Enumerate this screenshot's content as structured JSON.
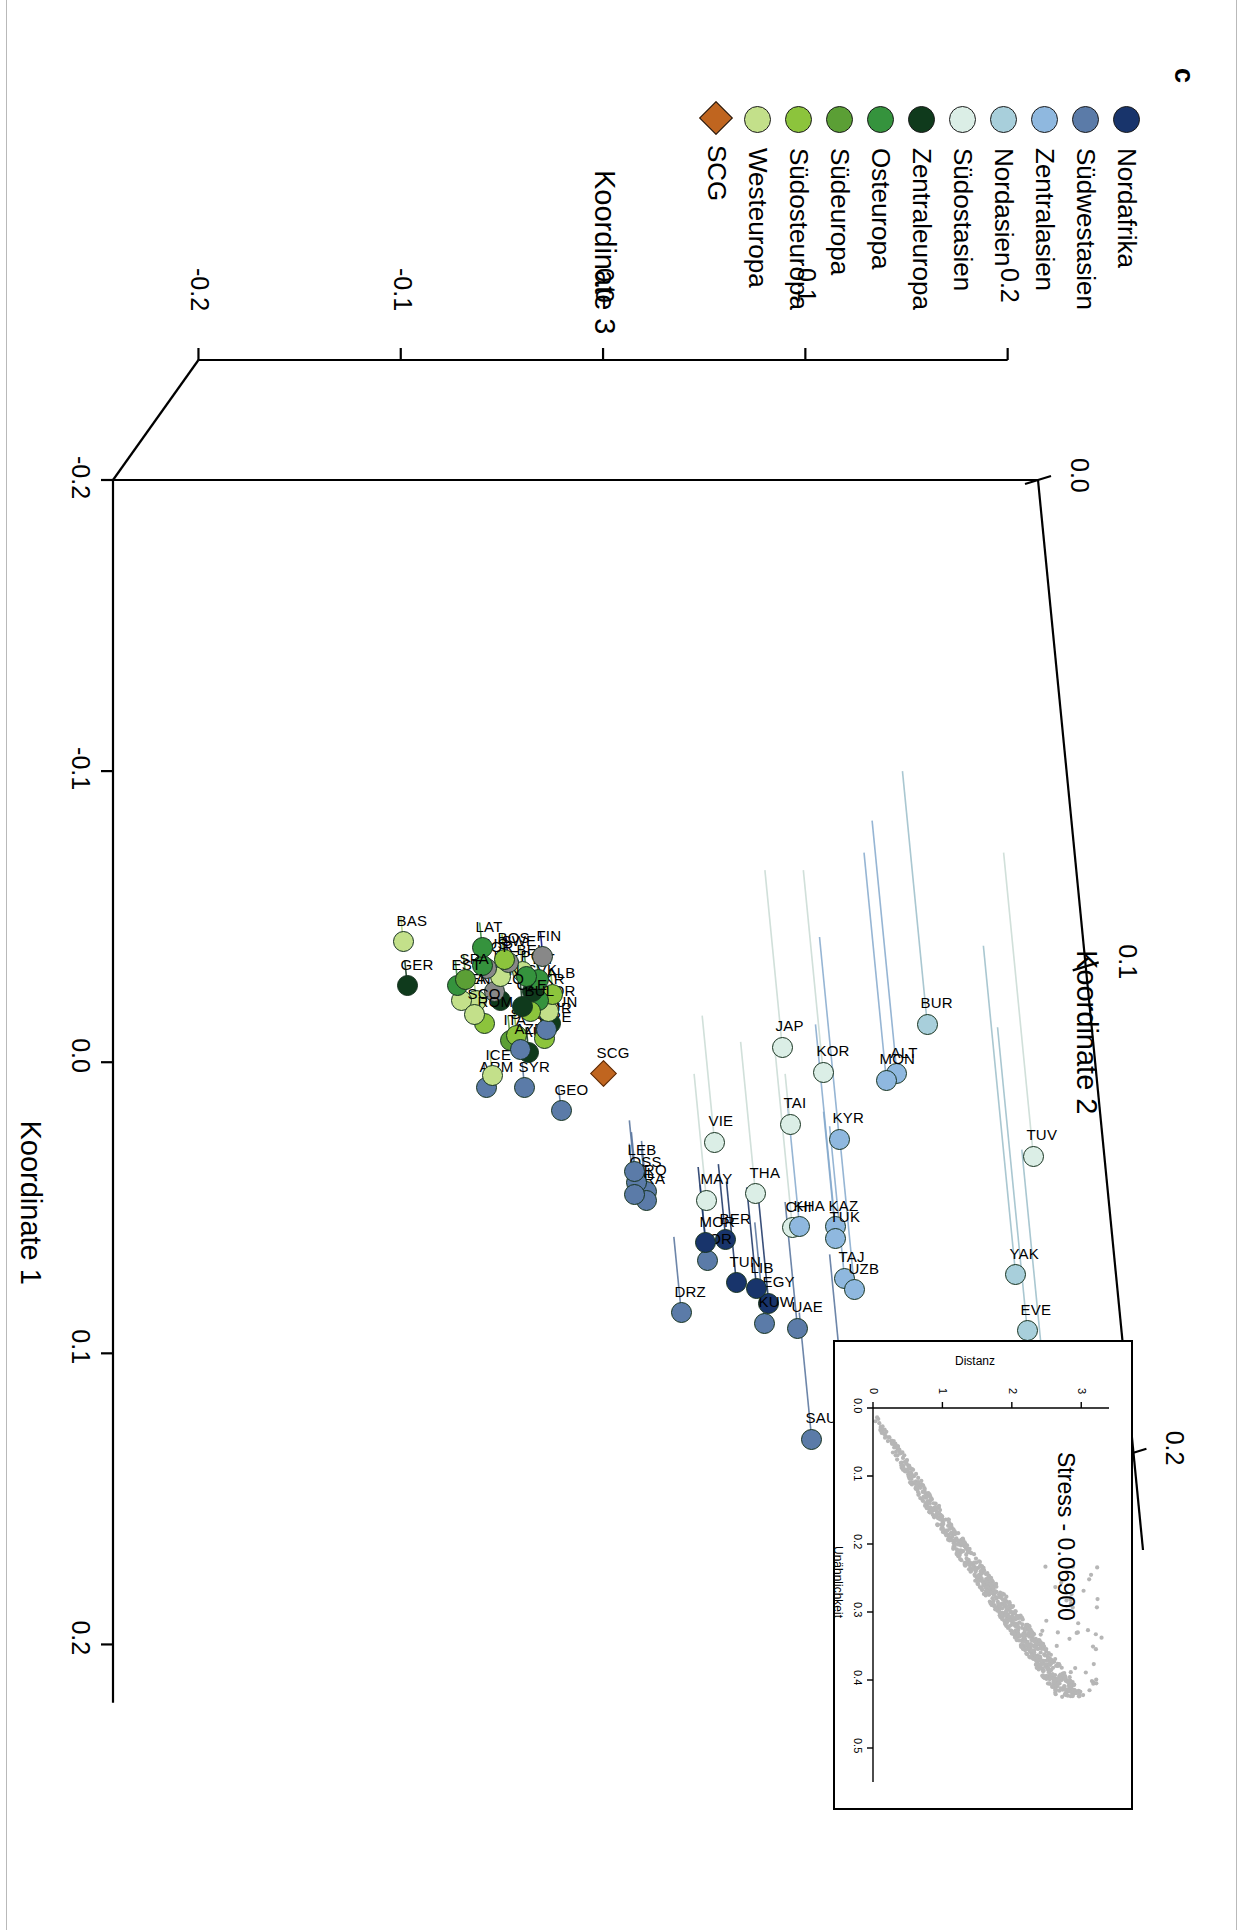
{
  "panel": {
    "letter": "c"
  },
  "legend": {
    "items": [
      {
        "label": "Nordafrika",
        "color": "#18346b",
        "shape": "circle"
      },
      {
        "label": "Südwestasien",
        "color": "#5b7ba8",
        "shape": "circle"
      },
      {
        "label": "Zentralasien",
        "color": "#8fb8df",
        "shape": "circle"
      },
      {
        "label": "Nordasien",
        "color": "#a8cfdb",
        "shape": "circle"
      },
      {
        "label": "Südostasien",
        "color": "#dbeee6",
        "shape": "circle"
      },
      {
        "label": "Zentraleuropa",
        "color": "#0f3a1c",
        "shape": "circle"
      },
      {
        "label": "Osteuropa",
        "color": "#35933d",
        "shape": "circle"
      },
      {
        "label": "Südeuropa",
        "color": "#5b9f35",
        "shape": "circle"
      },
      {
        "label": "Südosteuropa",
        "color": "#8cc43c",
        "shape": "circle"
      },
      {
        "label": "Westeuropa",
        "color": "#c3e08a",
        "shape": "circle"
      },
      {
        "label": "SCG",
        "color": "#c0651f",
        "shape": "diamond"
      }
    ]
  },
  "axes": {
    "x": {
      "title": "Koordinate 1",
      "ticks": [
        "-0.2",
        "-0.1",
        "0.0",
        "0.1",
        "0.2"
      ],
      "values": [
        -0.2,
        -0.1,
        0.0,
        0.1,
        0.2
      ]
    },
    "y": {
      "title": "Koordinate 3",
      "ticks": [
        "-0.2",
        "-0.1",
        "0.0",
        "0.1",
        "0.2"
      ],
      "values": [
        -0.2,
        -0.1,
        0.0,
        0.1,
        0.2
      ]
    },
    "z": {
      "title": "Koordinate 2",
      "ticks": [
        "0.0",
        "0.1",
        "0.2"
      ],
      "values": [
        0.0,
        0.1,
        0.2
      ]
    }
  },
  "inset": {
    "stress_label": "Stress - 0.06900",
    "xlabel": "Unähnlichkeit",
    "ylabel": "Distanz",
    "xticks": [
      "0.0",
      "0.1",
      "0.2",
      "0.3",
      "0.4",
      "0.5"
    ],
    "yticks": [
      "0",
      "1",
      "2",
      "3"
    ],
    "point_color": "#b6b6b6"
  },
  "chart_data": {
    "type": "scatter",
    "title": "",
    "xlabel": "Koordinate 1",
    "ylabel": "Koordinate 3",
    "zlabel": "Koordinate 2",
    "xlim": [
      -0.2,
      0.25
    ],
    "ylim": [
      -0.2,
      0.2
    ],
    "zlim": [
      -0.05,
      0.22
    ],
    "grid": false,
    "legend_position": "top-left",
    "groups": [
      "Nordafrika",
      "Südwestasien",
      "Zentralasien",
      "Nordasien",
      "Südostasien",
      "Zentraleuropa",
      "Osteuropa",
      "Südeuropa",
      "Südosteuropa",
      "Westeuropa",
      "SCG"
    ],
    "points": [
      {
        "label": "EVE",
        "group": "Nordasien",
        "x": -0.012,
        "y": 0.195,
        "z": 0.12
      },
      {
        "label": "KOY",
        "group": "Nordasien",
        "x": 0.03,
        "y": 0.207,
        "z": 0.14
      },
      {
        "label": "YAK",
        "group": "Nordasien",
        "x": -0.04,
        "y": 0.188,
        "z": 0.13
      },
      {
        "label": "TUV",
        "group": "Südostasien",
        "x": -0.072,
        "y": 0.198,
        "z": 0.12
      },
      {
        "label": "BUR",
        "group": "Nordasien",
        "x": -0.1,
        "y": 0.148,
        "z": 0.1
      },
      {
        "label": "ALT",
        "group": "Zentralasien",
        "x": -0.083,
        "y": 0.133,
        "z": 0.1
      },
      {
        "label": "MON",
        "group": "Zentralasien",
        "x": -0.072,
        "y": 0.129,
        "z": 0.09
      },
      {
        "label": "KOR",
        "group": "Südostasien",
        "x": -0.066,
        "y": 0.099,
        "z": 0.08
      },
      {
        "label": "JAP",
        "group": "Südostasien",
        "x": -0.066,
        "y": 0.08,
        "z": 0.07
      },
      {
        "label": "KYR",
        "group": "Zentralasien",
        "x": -0.043,
        "y": 0.107,
        "z": 0.08
      },
      {
        "label": "KAZ",
        "group": "Zentralasien",
        "x": -0.013,
        "y": 0.105,
        "z": 0.08
      },
      {
        "label": "CHI",
        "group": "Südostasien",
        "x": -0.004,
        "y": 0.085,
        "z": 0.07
      },
      {
        "label": "THA",
        "group": "Südostasien",
        "x": -0.007,
        "y": 0.068,
        "z": 0.06
      },
      {
        "label": "MAY",
        "group": "Südostasien",
        "x": 0.004,
        "y": 0.045,
        "z": 0.05
      },
      {
        "label": "VIE",
        "group": "Südostasien",
        "x": -0.016,
        "y": 0.049,
        "z": 0.05
      },
      {
        "label": "TAJ",
        "group": "Zentralasien",
        "x": 0.022,
        "y": 0.112,
        "z": 0.06
      },
      {
        "label": "UZB",
        "group": "Zentralasien",
        "x": 0.026,
        "y": 0.117,
        "z": 0.06
      },
      {
        "label": "TUK",
        "group": "Zentralasien",
        "x": 0.017,
        "y": 0.109,
        "z": 0.05
      },
      {
        "label": "KHA",
        "group": "Zentralasien",
        "x": 0.013,
        "y": 0.091,
        "z": 0.05
      },
      {
        "label": "YEM",
        "group": "Südwestasien",
        "x": 0.066,
        "y": 0.112,
        "z": 0.06
      },
      {
        "label": "SAU",
        "group": "Südwestasien",
        "x": 0.086,
        "y": 0.097,
        "z": 0.05
      },
      {
        "label": "UAE",
        "group": "Südwestasien",
        "x": 0.048,
        "y": 0.09,
        "z": 0.05
      },
      {
        "label": "EGY",
        "group": "Nordafrika",
        "x": 0.048,
        "y": 0.077,
        "z": 0.04
      },
      {
        "label": "KUW",
        "group": "Südwestasien",
        "x": 0.055,
        "y": 0.075,
        "z": 0.04
      },
      {
        "label": "LIB",
        "group": "Nordafrika",
        "x": 0.043,
        "y": 0.071,
        "z": 0.04
      },
      {
        "label": "TUN",
        "group": "Nordafrika",
        "x": 0.041,
        "y": 0.061,
        "z": 0.04
      },
      {
        "label": "BER",
        "group": "Nordafrika",
        "x": 0.035,
        "y": 0.057,
        "z": 0.03
      },
      {
        "label": "JOR",
        "group": "Südwestasien",
        "x": 0.042,
        "y": 0.048,
        "z": 0.03
      },
      {
        "label": "MOR",
        "group": "Nordafrika",
        "x": 0.036,
        "y": 0.047,
        "z": 0.03
      },
      {
        "label": "DRZ",
        "group": "Südwestasien",
        "x": 0.06,
        "y": 0.035,
        "z": 0.03
      },
      {
        "label": "IRQ",
        "group": "Südwestasien",
        "x": 0.027,
        "y": 0.019,
        "z": 0.02
      },
      {
        "label": "IRA",
        "group": "Südwestasien",
        "x": 0.03,
        "y": 0.019,
        "z": 0.02
      },
      {
        "label": "OSS",
        "group": "Südwestasien",
        "x": 0.024,
        "y": 0.014,
        "z": 0.02
      },
      {
        "label": "PAL",
        "group": "Südwestasien",
        "x": 0.028,
        "y": 0.013,
        "z": 0.02
      },
      {
        "label": "LEB",
        "group": "Südwestasien",
        "x": 0.02,
        "y": 0.013,
        "z": 0.02
      },
      {
        "label": "SCG",
        "group": "SCG",
        "x": 0.004,
        "y": 0.0,
        "z": 0.0
      },
      {
        "label": "GEO",
        "group": "Südwestasien",
        "x": 0.008,
        "y": -0.022,
        "z": 0.01
      },
      {
        "label": "SYR",
        "group": "Südwestasien",
        "x": 0.0,
        "y": -0.04,
        "z": 0.01
      },
      {
        "label": "ARM",
        "group": "Südwestasien",
        "x": 0.0,
        "y": -0.059,
        "z": 0.01
      },
      {
        "label": "ICE",
        "group": "Westeuropa",
        "x": -0.004,
        "y": -0.056,
        "z": 0.01
      },
      {
        "label": "AUS",
        "group": "Zentraleuropa",
        "x": -0.012,
        "y": -0.038,
        "z": 0.01
      },
      {
        "label": "ITA",
        "group": "Südeuropa",
        "x": -0.016,
        "y": -0.047,
        "z": 0.01
      },
      {
        "label": "SVA",
        "group": "Südosteuropa",
        "x": -0.018,
        "y": -0.044,
        "z": 0.01
      },
      {
        "label": "AZE",
        "group": "Südwestasien",
        "x": -0.013,
        "y": -0.042,
        "z": 0.01
      },
      {
        "label": "GRE",
        "group": "Südosteuropa",
        "x": -0.017,
        "y": -0.03,
        "z": 0.01
      },
      {
        "label": "HUN",
        "group": "Zentraleuropa",
        "x": -0.022,
        "y": -0.027,
        "z": 0.01
      },
      {
        "label": "TUR",
        "group": "Südwestasien",
        "x": -0.02,
        "y": -0.029,
        "z": 0.01
      },
      {
        "label": "POR",
        "group": "Westeuropa",
        "x": -0.026,
        "y": -0.028,
        "z": 0.01
      },
      {
        "label": "ALB",
        "group": "Südosteuropa",
        "x": -0.032,
        "y": -0.026,
        "z": 0.01
      },
      {
        "label": "UKR",
        "group": "Osteuropa",
        "x": -0.03,
        "y": -0.033,
        "z": 0.01
      },
      {
        "label": "SVK",
        "group": "Zentraleuropa",
        "x": -0.033,
        "y": -0.036,
        "z": 0.01
      },
      {
        "label": "LIT",
        "group": "Osteuropa",
        "x": -0.037,
        "y": -0.033,
        "z": 0.01
      },
      {
        "label": "BUL",
        "group": "Südosteuropa",
        "x": -0.026,
        "y": -0.037,
        "z": 0.01
      },
      {
        "label": "CZE",
        "group": "Zentraleuropa",
        "x": -0.028,
        "y": -0.041,
        "z": 0.01
      },
      {
        "label": "BEL",
        "group": "Westeuropa",
        "x": -0.04,
        "y": -0.041,
        "z": 0.01
      },
      {
        "label": "POL",
        "group": "Osteuropa",
        "x": -0.038,
        "y": -0.039,
        "z": 0.01
      },
      {
        "label": "FIN",
        "group": "Nordeuropa",
        "x": -0.045,
        "y": -0.031,
        "z": 0.01
      },
      {
        "label": "SLO",
        "group": "Zentraleuropa",
        "x": -0.03,
        "y": -0.052,
        "z": 0.01
      },
      {
        "label": "DEN",
        "group": "Nordeuropa",
        "x": -0.033,
        "y": -0.055,
        "z": 0.01
      },
      {
        "label": "ENG",
        "group": "Westeuropa",
        "x": -0.03,
        "y": -0.064,
        "z": 0.01
      },
      {
        "label": "IRE",
        "group": "Westeuropa",
        "x": -0.038,
        "y": -0.052,
        "z": 0.01
      },
      {
        "label": "SWE",
        "group": "Nordeuropa",
        "x": -0.043,
        "y": -0.048,
        "z": 0.01
      },
      {
        "label": "BOS",
        "group": "Südosteuropa",
        "x": -0.044,
        "y": -0.05,
        "z": 0.01
      },
      {
        "label": "NOR",
        "group": "Nordeuropa",
        "x": -0.041,
        "y": -0.059,
        "z": 0.01
      },
      {
        "label": "RUS",
        "group": "Osteuropa",
        "x": -0.042,
        "y": -0.061,
        "z": 0.01
      },
      {
        "label": "LAT",
        "group": "Osteuropa",
        "x": -0.048,
        "y": -0.061,
        "z": 0.01
      },
      {
        "label": "FRA",
        "group": "Westeuropa",
        "x": -0.03,
        "y": -0.071,
        "z": 0.01
      },
      {
        "label": "EST",
        "group": "Osteuropa",
        "x": -0.035,
        "y": -0.073,
        "z": 0.01
      },
      {
        "label": "SPA",
        "group": "Südeuropa",
        "x": -0.037,
        "y": -0.069,
        "z": 0.01
      },
      {
        "label": "ROM",
        "group": "Südosteuropa",
        "x": -0.022,
        "y": -0.06,
        "z": 0.01
      },
      {
        "label": "SCO",
        "group": "Westeuropa",
        "x": -0.025,
        "y": -0.065,
        "z": 0.01
      },
      {
        "label": "GER",
        "group": "Zentraleuropa",
        "x": -0.035,
        "y": -0.098,
        "z": 0.01
      },
      {
        "label": "BAS",
        "group": "Westeuropa",
        "x": -0.05,
        "y": -0.1,
        "z": 0.01
      },
      {
        "label": "TAI",
        "group": "Südostasien",
        "x": 0.004,
        "y": 0.09,
        "z": 0.02
      }
    ]
  }
}
